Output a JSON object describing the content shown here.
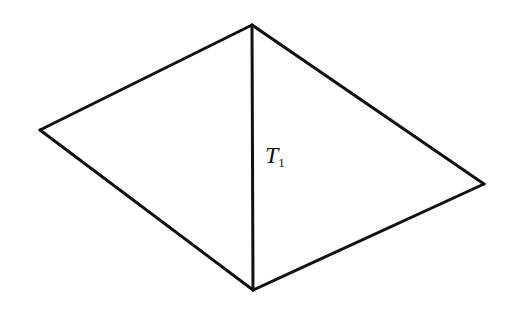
{
  "diagram": {
    "stroke_color": "#111111",
    "background": "#ffffff",
    "vertices": {
      "top": [
        252,
        25
      ],
      "left": [
        40,
        130
      ],
      "right": [
        484,
        184
      ],
      "bottom": [
        253,
        290
      ]
    },
    "edges": [
      [
        "top",
        "left"
      ],
      [
        "left",
        "bottom"
      ],
      [
        "top",
        "right"
      ],
      [
        "right",
        "bottom"
      ],
      [
        "top",
        "bottom"
      ]
    ],
    "label": {
      "main": "T",
      "sub": "1"
    }
  }
}
